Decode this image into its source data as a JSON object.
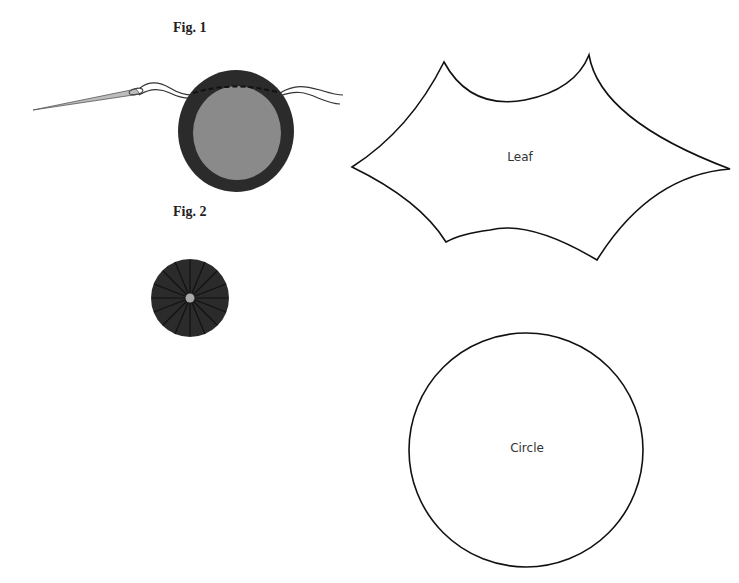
{
  "figures": {
    "fig1": {
      "label": "Fig. 1",
      "outer_color": "#2b2b2b",
      "inner_color": "#8a8a8a"
    },
    "fig2": {
      "label": "Fig. 2",
      "color": "#2b2b2b",
      "center_color": "#a8a8a8"
    }
  },
  "templates": {
    "leaf": {
      "label": "Leaf"
    },
    "circle": {
      "label": "Circle"
    }
  }
}
